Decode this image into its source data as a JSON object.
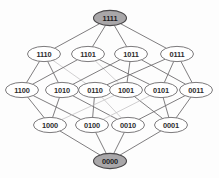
{
  "diagram": {
    "type": "lattice-hasse-diagram",
    "colors": {
      "background": "#fdfdfd",
      "node_fill": "#ffffff",
      "node_fill_extremal": "#a9a7a9",
      "node_stroke": "#6d6b6d",
      "edge_stroke": "#706e70",
      "edge_stroke_faint": "#c8c6c8",
      "label_text": "#2e2c2e"
    },
    "geometry": {
      "width": 219,
      "height": 178,
      "node_rx": 16.5,
      "node_ry": 7.6
    },
    "levels": [
      {
        "rank": 4,
        "y": 18
      },
      {
        "rank": 3,
        "y": 54
      },
      {
        "rank": 2,
        "y": 90
      },
      {
        "rank": 1,
        "y": 125
      },
      {
        "rank": 0,
        "y": 161
      }
    ],
    "nodes": [
      {
        "id": "1111",
        "label": "1111",
        "x": 110,
        "y": 18,
        "rank": 4,
        "filled": true
      },
      {
        "id": "1110",
        "label": "1110",
        "x": 44,
        "y": 54,
        "rank": 3,
        "filled": false
      },
      {
        "id": "1101",
        "label": "1101",
        "x": 88,
        "y": 54,
        "rank": 3,
        "filled": false
      },
      {
        "id": "1011",
        "label": "1011",
        "x": 131,
        "y": 54,
        "rank": 3,
        "filled": false
      },
      {
        "id": "0111",
        "label": "0111",
        "x": 177,
        "y": 54,
        "rank": 3,
        "filled": false
      },
      {
        "id": "1100",
        "label": "1100",
        "x": 22,
        "y": 90,
        "rank": 2,
        "filled": false
      },
      {
        "id": "1010",
        "label": "1010",
        "x": 62,
        "y": 90,
        "rank": 2,
        "filled": false
      },
      {
        "id": "0110",
        "label": "0110",
        "x": 95,
        "y": 90,
        "rank": 2,
        "filled": false
      },
      {
        "id": "1001",
        "label": "1001",
        "x": 126,
        "y": 90,
        "rank": 2,
        "filled": false
      },
      {
        "id": "0101",
        "label": "0101",
        "x": 161,
        "y": 90,
        "rank": 2,
        "filled": false
      },
      {
        "id": "0011",
        "label": "0011",
        "x": 196,
        "y": 90,
        "rank": 2,
        "filled": false
      },
      {
        "id": "1000",
        "label": "1000",
        "x": 50,
        "y": 125,
        "rank": 1,
        "filled": false
      },
      {
        "id": "0100",
        "label": "0100",
        "x": 92,
        "y": 125,
        "rank": 1,
        "filled": false
      },
      {
        "id": "0010",
        "label": "0010",
        "x": 128,
        "y": 125,
        "rank": 1,
        "filled": false
      },
      {
        "id": "0001",
        "label": "0001",
        "x": 171,
        "y": 125,
        "rank": 1,
        "filled": false
      },
      {
        "id": "0000",
        "label": "0000",
        "x": 110,
        "y": 161,
        "rank": 0,
        "filled": true
      }
    ],
    "edges": [
      {
        "from": "1111",
        "to": "1110",
        "faint": false
      },
      {
        "from": "1111",
        "to": "1101",
        "faint": false
      },
      {
        "from": "1111",
        "to": "1011",
        "faint": false
      },
      {
        "from": "1111",
        "to": "0111",
        "faint": false
      },
      {
        "from": "1110",
        "to": "1100",
        "faint": false
      },
      {
        "from": "1110",
        "to": "1010",
        "faint": false
      },
      {
        "from": "1110",
        "to": "0110",
        "faint": true
      },
      {
        "from": "1101",
        "to": "1100",
        "faint": false
      },
      {
        "from": "1101",
        "to": "1001",
        "faint": true
      },
      {
        "from": "1101",
        "to": "0101",
        "faint": false
      },
      {
        "from": "1011",
        "to": "1010",
        "faint": false
      },
      {
        "from": "1011",
        "to": "1001",
        "faint": false
      },
      {
        "from": "1011",
        "to": "0011",
        "faint": false
      },
      {
        "from": "0111",
        "to": "0110",
        "faint": false
      },
      {
        "from": "0111",
        "to": "0101",
        "faint": false
      },
      {
        "from": "0111",
        "to": "0011",
        "faint": false
      },
      {
        "from": "1100",
        "to": "1000",
        "faint": false
      },
      {
        "from": "1100",
        "to": "0100",
        "faint": false
      },
      {
        "from": "1010",
        "to": "1000",
        "faint": false
      },
      {
        "from": "1010",
        "to": "0010",
        "faint": false
      },
      {
        "from": "0110",
        "to": "0100",
        "faint": false
      },
      {
        "from": "0110",
        "to": "0010",
        "faint": true
      },
      {
        "from": "1001",
        "to": "1000",
        "faint": true
      },
      {
        "from": "1001",
        "to": "0001",
        "faint": false
      },
      {
        "from": "0101",
        "to": "0100",
        "faint": true
      },
      {
        "from": "0101",
        "to": "0001",
        "faint": false
      },
      {
        "from": "0011",
        "to": "0010",
        "faint": false
      },
      {
        "from": "0011",
        "to": "0001",
        "faint": false
      },
      {
        "from": "1000",
        "to": "0000",
        "faint": false
      },
      {
        "from": "0100",
        "to": "0000",
        "faint": false
      },
      {
        "from": "0010",
        "to": "0000",
        "faint": false
      },
      {
        "from": "0001",
        "to": "0000",
        "faint": false
      }
    ]
  }
}
